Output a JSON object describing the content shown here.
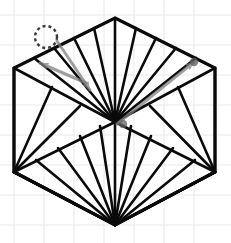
{
  "canvas": {
    "width": 231,
    "height": 243,
    "background_color": "#ffffff",
    "title": "hexagon-triangulation-fan-diagram"
  },
  "grid": {
    "visible": true,
    "color": "#e8e8e8",
    "line_width": 1,
    "spacing": 30,
    "origin_x": 14,
    "origin_y": 15,
    "x_lines": [
      14,
      44,
      74,
      104,
      134,
      164,
      194
    ],
    "y_lines": [
      15,
      45,
      75,
      105,
      135,
      165,
      195,
      225
    ]
  },
  "figure": {
    "name": "hexagon",
    "stroke_color": "#0a0a0a",
    "outline_width": 3.2,
    "fan_width": 2.6,
    "fill": "none",
    "vertices": [
      {
        "id": "top",
        "label": "V1",
        "x": 115,
        "y": 18
      },
      {
        "id": "upper-right",
        "label": "V2",
        "x": 215,
        "y": 68
      },
      {
        "id": "lower-right",
        "label": "V3",
        "x": 215,
        "y": 172
      },
      {
        "id": "bottom",
        "label": "V4",
        "x": 115,
        "y": 225
      },
      {
        "id": "lower-left",
        "label": "V5",
        "x": 14,
        "y": 172
      },
      {
        "id": "upper-left",
        "label": "V6",
        "x": 14,
        "y": 68
      }
    ],
    "center": {
      "id": "center",
      "label": "C",
      "x": 115,
      "y": 122
    },
    "fans": [
      {
        "name": "center-upper-fan",
        "apex": {
          "x": 115,
          "y": 122
        },
        "targets": [
          {
            "x": 14,
            "y": 68
          },
          {
            "x": 34,
            "y": 58
          },
          {
            "x": 54,
            "y": 48
          },
          {
            "x": 74,
            "y": 38
          },
          {
            "x": 94,
            "y": 28
          },
          {
            "x": 115,
            "y": 18
          },
          {
            "x": 136,
            "y": 28
          },
          {
            "x": 156,
            "y": 38
          },
          {
            "x": 176,
            "y": 48
          },
          {
            "x": 196,
            "y": 58
          },
          {
            "x": 215,
            "y": 68
          }
        ]
      },
      {
        "name": "bottom-vertex-fan",
        "apex": {
          "x": 115,
          "y": 225
        },
        "targets": [
          {
            "x": 14,
            "y": 172
          },
          {
            "x": 36,
            "y": 160
          },
          {
            "x": 58,
            "y": 148
          },
          {
            "x": 80,
            "y": 136
          },
          {
            "x": 100,
            "y": 126
          },
          {
            "x": 115,
            "y": 122
          },
          {
            "x": 131,
            "y": 126
          },
          {
            "x": 151,
            "y": 136
          },
          {
            "x": 173,
            "y": 148
          },
          {
            "x": 195,
            "y": 160
          },
          {
            "x": 215,
            "y": 172
          }
        ]
      },
      {
        "name": "lower-left-vertex-fan",
        "apex": {
          "x": 14,
          "y": 172
        },
        "targets": [
          {
            "x": 14,
            "y": 68
          },
          {
            "x": 52,
            "y": 87
          },
          {
            "x": 80,
            "y": 106
          },
          {
            "x": 115,
            "y": 122
          },
          {
            "x": 115,
            "y": 225
          },
          {
            "x": 72,
            "y": 202
          },
          {
            "x": 94,
            "y": 214
          }
        ]
      },
      {
        "name": "lower-right-vertex-fan",
        "apex": {
          "x": 215,
          "y": 172
        },
        "targets": [
          {
            "x": 215,
            "y": 68
          },
          {
            "x": 178,
            "y": 87
          },
          {
            "x": 150,
            "y": 106
          },
          {
            "x": 115,
            "y": 122
          },
          {
            "x": 115,
            "y": 225
          },
          {
            "x": 158,
            "y": 202
          },
          {
            "x": 136,
            "y": 214
          }
        ]
      }
    ]
  },
  "annotations": {
    "cursor_color": "#6e6e6e",
    "arrow_color": "#808080",
    "arrow_opacity": 0.75,
    "arrow_width": 3.0,
    "drag_origin_marker": {
      "name": "drag-origin-dashed-circle",
      "x": 46,
      "y": 37,
      "radius": 11,
      "stroke_color": "#3a3a3a",
      "dash": "3 3",
      "line_width": 2.4
    },
    "arrows": [
      {
        "name": "drag-arrow-to-upper-left",
        "from": {
          "x": 86,
          "y": 83
        },
        "to": {
          "x": 40,
          "y": 63
        },
        "head_size": 9
      },
      {
        "name": "drag-arrow-to-center",
        "from": {
          "x": 57,
          "y": 41
        },
        "to": {
          "x": 90,
          "y": 90
        },
        "head_size": 9
      },
      {
        "name": "drag-arrow-to-upper-right",
        "from": {
          "x": 117,
          "y": 124
        },
        "to": {
          "x": 194,
          "y": 62
        },
        "head_size": 9
      }
    ],
    "endpoint_dots": [
      {
        "name": "endpoint-dot-upper-right",
        "x": 194,
        "y": 62,
        "radius": 4.2,
        "color": "#5e5e5e"
      },
      {
        "name": "endpoint-dot-center",
        "x": 123,
        "y": 124,
        "radius": 4.2,
        "color": "#5e5e5e"
      }
    ]
  }
}
